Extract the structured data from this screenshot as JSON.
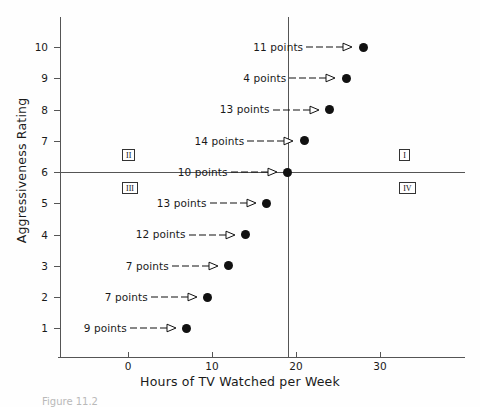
{
  "chart_data": {
    "type": "scatter",
    "title": "",
    "xlabel": "Hours of TV Watched per Week",
    "ylabel": "Aggressiveness Rating",
    "xlim": [
      -8,
      40
    ],
    "ylim": [
      0,
      11
    ],
    "xticks": [
      0,
      10,
      20,
      30
    ],
    "yticks": [
      1,
      2,
      3,
      4,
      5,
      6,
      7,
      8,
      9,
      10
    ],
    "grid": false,
    "legend": null,
    "reference_lines": {
      "horizontal": {
        "y": 6,
        "label": "mean aggressiveness rating"
      },
      "vertical": {
        "x": 19,
        "label": "mean hours of TV watched"
      }
    },
    "points": [
      {
        "x": 28,
        "y": 10,
        "label": "11 points"
      },
      {
        "x": 26,
        "y": 9,
        "label": "4 points"
      },
      {
        "x": 24,
        "y": 8,
        "label": "13 points"
      },
      {
        "x": 21,
        "y": 7,
        "label": "14 points"
      },
      {
        "x": 19,
        "y": 6,
        "label": "10 points"
      },
      {
        "x": 16.5,
        "y": 5,
        "label": "13 points"
      },
      {
        "x": 14,
        "y": 4,
        "label": "12 points"
      },
      {
        "x": 12,
        "y": 3,
        "label": "7 points"
      },
      {
        "x": 9.5,
        "y": 2,
        "label": "7 points"
      },
      {
        "x": 7,
        "y": 1,
        "label": "9 points"
      }
    ],
    "quadrants": [
      {
        "name": "I",
        "x": 33,
        "y": 6.55
      },
      {
        "name": "II",
        "x": 0,
        "y": 6.55
      },
      {
        "name": "III",
        "x": 0,
        "y": 5.5
      },
      {
        "name": "IV",
        "x": 33,
        "y": 5.5
      }
    ],
    "annotation_arrow_style": "dashed-line-with-open-triangle-head"
  },
  "axis": {
    "x_title": "Hours of TV Watched per Week",
    "y_title": "Aggressiveness Rating",
    "x_tick_labels": [
      "0",
      "10",
      "20",
      "30"
    ],
    "y_tick_labels": [
      "1",
      "2",
      "3",
      "4",
      "5",
      "6",
      "7",
      "8",
      "9",
      "10"
    ]
  },
  "annotations": [
    "11 points",
    "4 points",
    "13 points",
    "14 points",
    "10 points",
    "13 points",
    "12 points",
    "7 points",
    "7 points",
    "9 points"
  ],
  "quadrant_labels": [
    "I",
    "II",
    "III",
    "IV"
  ],
  "caption": "Figure 11.2  ",
  "colors": {
    "point": "#111111",
    "axis": "#555555",
    "text": "#1a1a1a",
    "background": "#fefefe"
  }
}
